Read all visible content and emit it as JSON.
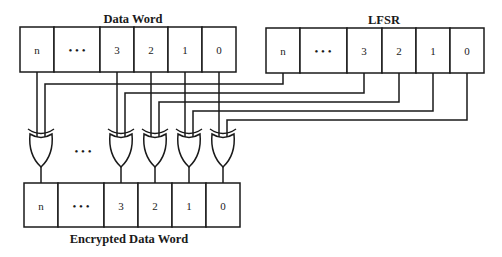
{
  "diagram": {
    "data_word": {
      "title": "Data Word",
      "cells": [
        "n",
        "• • •",
        "3",
        "2",
        "1",
        "0"
      ]
    },
    "lfsr": {
      "title": "LFSR",
      "cells": [
        "n",
        "• • •",
        "3",
        "2",
        "1",
        "0"
      ]
    },
    "gates": {
      "type": "XOR",
      "count_visible": 5,
      "ellipsis": "• • •"
    },
    "encrypted_word": {
      "title": "Encrypted Data Word",
      "cells": [
        "n",
        "• • •",
        "3",
        "2",
        "1",
        "0"
      ]
    },
    "colors": {
      "line": "#1a1a1a",
      "background": "#ffffff"
    }
  }
}
